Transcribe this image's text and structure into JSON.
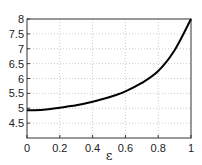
{
  "chart_data": {
    "type": "line",
    "title": "",
    "xlabel": "ε",
    "ylabel": "",
    "xlim": [
      0,
      1
    ],
    "ylim": [
      4,
      8
    ],
    "grid": true,
    "xticks": [
      "0",
      "0.2",
      "0.4",
      "0.6",
      "0.8",
      "1"
    ],
    "yticks": [
      "4.5",
      "5",
      "5.5",
      "6",
      "6.5",
      "7",
      "7.5",
      "8"
    ],
    "series": [
      {
        "name": "curve",
        "color": "#000000",
        "x": [
          0,
          0.1,
          0.2,
          0.3,
          0.4,
          0.5,
          0.6,
          0.7,
          0.8,
          0.9,
          1.0
        ],
        "y": [
          4.93,
          4.95,
          5.02,
          5.1,
          5.22,
          5.37,
          5.57,
          5.85,
          6.25,
          6.95,
          8.0
        ]
      }
    ]
  }
}
